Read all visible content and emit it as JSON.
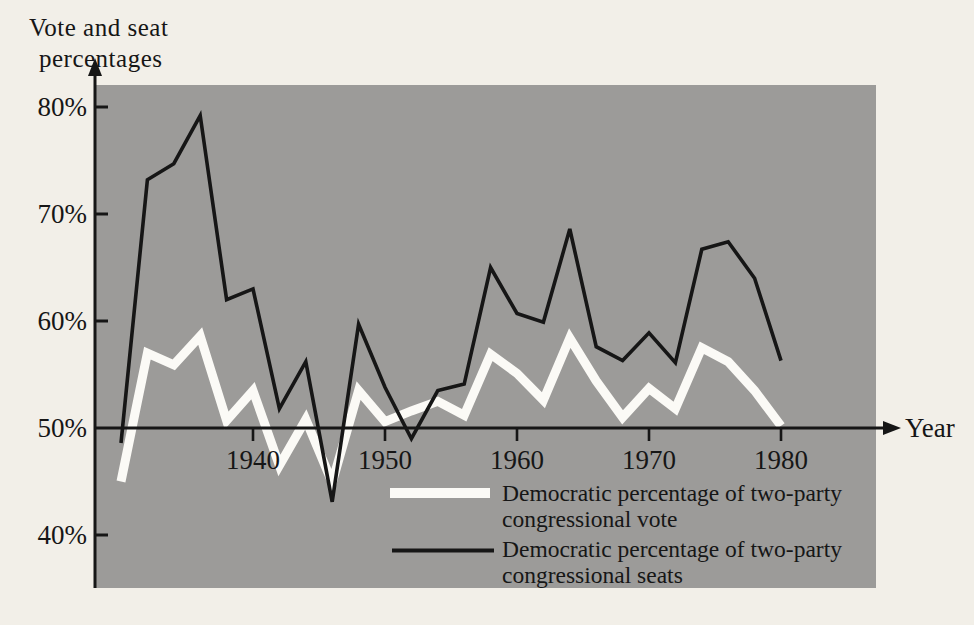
{
  "figure": {
    "title_line1": "Vote and seat",
    "title_line2": "percentages",
    "x_axis_title": "Year"
  },
  "colors": {
    "page_background": "#f2efe8",
    "plot_background": "#9c9b99",
    "axis": "#161616",
    "vote_line": "#fbfaf6",
    "seats_line": "#161616"
  },
  "legend": [
    {
      "key": "vote",
      "lines": [
        "Democratic percentage of two-party",
        "congressional vote"
      ]
    },
    {
      "key": "seats",
      "lines": [
        "Democratic percentage of two-party",
        "congressional seats"
      ]
    }
  ],
  "chart_data": {
    "type": "line",
    "title": "Vote and seat percentages",
    "xlabel": "Year",
    "ylabel": "Vote and seat percentages",
    "grid": false,
    "legend_position": "inside-bottom-center",
    "baseline_value": 50,
    "xlim": [
      1929,
      1987
    ],
    "ylim": [
      35,
      82
    ],
    "x": [
      1930,
      1932,
      1934,
      1936,
      1938,
      1940,
      1942,
      1944,
      1946,
      1948,
      1950,
      1952,
      1954,
      1956,
      1958,
      1960,
      1962,
      1964,
      1966,
      1968,
      1970,
      1972,
      1974,
      1976,
      1978,
      1980
    ],
    "series": [
      {
        "key": "vote",
        "name": "Democratic percentage of two-party congressional vote",
        "color_key": "vote_line",
        "values": [
          45.0,
          57.0,
          55.9,
          58.6,
          50.7,
          53.5,
          46.5,
          50.8,
          44.9,
          53.5,
          50.6,
          51.6,
          52.5,
          51.2,
          56.9,
          55.1,
          52.6,
          58.4,
          54.4,
          51.0,
          53.7,
          51.8,
          57.5,
          56.2,
          53.5,
          50.2
        ]
      },
      {
        "key": "seats",
        "name": "Democratic percentage of two-party congressional seats",
        "color_key": "seats_line",
        "values": [
          48.6,
          73.2,
          74.7,
          79.2,
          62.0,
          63.0,
          51.8,
          56.2,
          43.1,
          59.7,
          53.8,
          49.0,
          53.5,
          54.1,
          65.0,
          60.7,
          59.9,
          68.6,
          57.6,
          56.3,
          58.9,
          56.1,
          66.7,
          67.4,
          64.0,
          56.3
        ]
      }
    ],
    "x_ticks": [
      {
        "value": 1940,
        "label": "1940"
      },
      {
        "value": 1950,
        "label": "1950"
      },
      {
        "value": 1960,
        "label": "1960"
      },
      {
        "value": 1970,
        "label": "1970"
      },
      {
        "value": 1980,
        "label": "1980"
      }
    ],
    "y_ticks": [
      {
        "value": 80,
        "label": "80%"
      },
      {
        "value": 70,
        "label": "70%"
      },
      {
        "value": 60,
        "label": "60%"
      },
      {
        "value": 50,
        "label": "50%"
      },
      {
        "value": 40,
        "label": "40%"
      }
    ]
  }
}
